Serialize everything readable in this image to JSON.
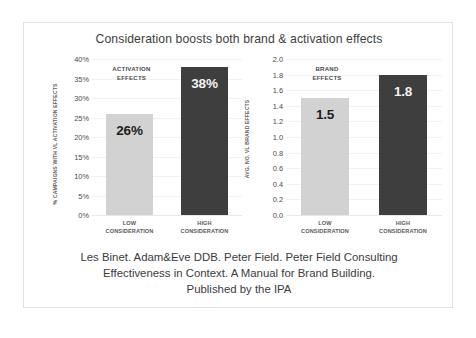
{
  "chart_data": {
    "type": "bar",
    "title": "Consideration boosts both brand & activation effects",
    "grid": true,
    "legend": "none",
    "panels": [
      {
        "name": "activation",
        "annotation": "ACTIVATION EFFECTS",
        "annotation_line1": "ACTIVATION",
        "annotation_line2": "EFFECTS",
        "ylabel": "% CAMPAIGNS WITH VL ACTIVATION EFFECTS",
        "xlabel": "",
        "ylim": [
          0,
          40
        ],
        "ticks": [
          "0%",
          "5%",
          "10%",
          "15%",
          "20%",
          "25%",
          "30%",
          "35%",
          "40%"
        ],
        "tick_values": [
          0,
          5,
          10,
          15,
          20,
          25,
          30,
          35,
          40
        ],
        "categories": [
          "LOW CONSIDERATION",
          "HIGH CONSIDERATION"
        ],
        "category_lines": [
          [
            "LOW",
            "CONSIDERATION"
          ],
          [
            "HIGH",
            "CONSIDERATION"
          ]
        ],
        "values": [
          26,
          38
        ],
        "data_labels": [
          "26%",
          "38%"
        ],
        "bar_colors": [
          "#d2d2d2",
          "#3e3e3e"
        ]
      },
      {
        "name": "brand",
        "annotation": "BRAND EFFECTS",
        "annotation_line1": "BRAND",
        "annotation_line2": "EFFECTS",
        "ylabel": "AVG. NO. VL BRAND EFFECTS",
        "xlabel": "",
        "ylim": [
          0,
          2.0
        ],
        "ticks": [
          "0.0",
          "0.2",
          "0.4",
          "0.6",
          "0.8",
          "1.0",
          "1.2",
          "1.4",
          "1.6",
          "1.8",
          "2.0"
        ],
        "tick_values": [
          0,
          0.2,
          0.4,
          0.6,
          0.8,
          1.0,
          1.2,
          1.4,
          1.6,
          1.8,
          2.0
        ],
        "categories": [
          "LOW CONSIDERATION",
          "HIGH CONSIDERATION"
        ],
        "category_lines": [
          [
            "LOW",
            "CONSIDERATION"
          ],
          [
            "HIGH",
            "CONSIDERATION"
          ]
        ],
        "values": [
          1.5,
          1.8
        ],
        "data_labels": [
          "1.5",
          "1.8"
        ],
        "bar_colors": [
          "#d2d2d2",
          "#3e3e3e"
        ]
      }
    ]
  },
  "caption": {
    "line1": "Les Binet. Adam&Eve DDB. Peter Field. Peter Field Consulting",
    "line2": "Effectiveness in Context. A Manual for Brand Building.",
    "line3": "Published by the IPA"
  },
  "colors": {
    "light_bar": "#d2d2d2",
    "dark_bar": "#3e3e3e",
    "title_text": "#3e3e3e",
    "grid": "#f1f1f1",
    "border": "#e2e2e2"
  }
}
